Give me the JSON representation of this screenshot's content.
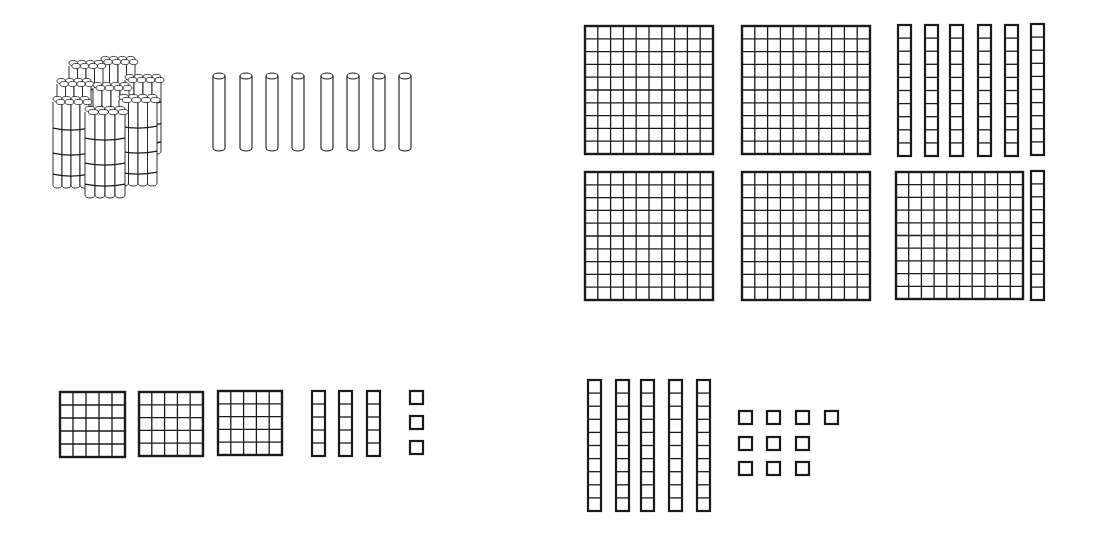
{
  "canvas": {
    "width": 1096,
    "height": 536,
    "background": "#ffffff",
    "ink": "#1a1a1a"
  },
  "panels": [
    {
      "id": "top-left",
      "description": "Bundle of ten bundles of sticks and 8 loose sticks",
      "bundle": {
        "x": 53,
        "y": 50,
        "w": 120,
        "h": 142
      },
      "sticks": {
        "xs": [
          213,
          240,
          266,
          292,
          321,
          347,
          373,
          399
        ],
        "y": 73,
        "w": 12,
        "h": 78
      }
    },
    {
      "id": "top-right",
      "description": "Base-ten blocks: 5 hundreds flats and 7 tens rods",
      "flats": [
        {
          "x": 585,
          "y": 26,
          "size": 128,
          "grid": 10
        },
        {
          "x": 742,
          "y": 26,
          "size": 128,
          "grid": 10
        },
        {
          "x": 585,
          "y": 172,
          "size": 128,
          "grid": 10
        },
        {
          "x": 742,
          "y": 172,
          "size": 128,
          "grid": 10
        },
        {
          "x": 896,
          "y": 172,
          "size": 127,
          "grid": 10
        }
      ],
      "rods": [
        {
          "x": 898,
          "y": 25,
          "w": 13,
          "h": 131,
          "cells": 10
        },
        {
          "x": 925,
          "y": 25,
          "w": 13,
          "h": 131,
          "cells": 10
        },
        {
          "x": 950,
          "y": 25,
          "w": 13,
          "h": 131,
          "cells": 10
        },
        {
          "x": 978,
          "y": 25,
          "w": 13,
          "h": 131,
          "cells": 10
        },
        {
          "x": 1005,
          "y": 25,
          "w": 13,
          "h": 131,
          "cells": 10
        },
        {
          "x": 1031,
          "y": 24,
          "w": 13,
          "h": 131,
          "cells": 10
        },
        {
          "x": 1031,
          "y": 171,
          "w": 13,
          "h": 129,
          "cells": 10
        }
      ],
      "units": []
    },
    {
      "id": "bottom-left",
      "description": "Base-five blocks: 3 flats (5x5), 3 rods (5), 3 units",
      "flats": [
        {
          "x": 60,
          "y": 392,
          "size": 65,
          "grid": 5
        },
        {
          "x": 139,
          "y": 392,
          "size": 64,
          "grid": 5
        },
        {
          "x": 218,
          "y": 391,
          "size": 64,
          "grid": 5
        }
      ],
      "rods": [
        {
          "x": 312,
          "y": 391,
          "w": 13,
          "h": 65,
          "cells": 5
        },
        {
          "x": 339,
          "y": 391,
          "w": 13,
          "h": 65,
          "cells": 5
        },
        {
          "x": 367,
          "y": 391,
          "w": 13,
          "h": 65,
          "cells": 5
        }
      ],
      "units": [
        {
          "x": 410,
          "y": 391,
          "size": 13
        },
        {
          "x": 410,
          "y": 416,
          "size": 13
        },
        {
          "x": 410,
          "y": 441,
          "size": 13
        }
      ]
    },
    {
      "id": "bottom-right",
      "description": "Base-ten blocks: 5 tens rods and 10 units",
      "flats": [],
      "rods": [
        {
          "x": 588,
          "y": 380,
          "w": 13,
          "h": 131,
          "cells": 10
        },
        {
          "x": 616,
          "y": 380,
          "w": 13,
          "h": 131,
          "cells": 10
        },
        {
          "x": 641,
          "y": 380,
          "w": 13,
          "h": 131,
          "cells": 10
        },
        {
          "x": 669,
          "y": 380,
          "w": 13,
          "h": 131,
          "cells": 10
        },
        {
          "x": 697,
          "y": 380,
          "w": 13,
          "h": 131,
          "cells": 10
        }
      ],
      "units": [
        {
          "x": 739,
          "y": 411,
          "size": 13
        },
        {
          "x": 767,
          "y": 411,
          "size": 13
        },
        {
          "x": 796,
          "y": 411,
          "size": 13
        },
        {
          "x": 825,
          "y": 411,
          "size": 13
        },
        {
          "x": 739,
          "y": 437,
          "size": 13
        },
        {
          "x": 767,
          "y": 437,
          "size": 13
        },
        {
          "x": 796,
          "y": 437,
          "size": 13
        },
        {
          "x": 739,
          "y": 462,
          "size": 13
        },
        {
          "x": 767,
          "y": 462,
          "size": 13
        },
        {
          "x": 796,
          "y": 462,
          "size": 13
        }
      ]
    }
  ]
}
